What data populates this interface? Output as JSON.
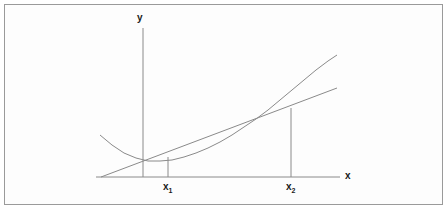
{
  "figure": {
    "kind": "math-diagram",
    "background_color": "#ffffff",
    "frame_color": "#9a9a9a",
    "stroke_color": "#8a8a8a",
    "label_color": "#1a1a1a"
  },
  "axes": {
    "y_label": "y",
    "x_label": "x",
    "origin_px": {
      "x": 143,
      "y": 177
    },
    "x_axis_from_px": 96,
    "x_axis_to_px": 340,
    "y_axis_top_px": 28,
    "y_axis_bottom_px": 177
  },
  "ticks": [
    {
      "name": "x1",
      "text": "x",
      "sub": "1",
      "x_px": 168
    },
    {
      "name": "x2",
      "text": "x",
      "sub": "2",
      "x_px": 291
    }
  ],
  "chart_data": {
    "type": "line",
    "title": "",
    "xlabel": "x",
    "ylabel": "y",
    "grid": false,
    "legend": false,
    "annotations": [
      "x₁",
      "x₂",
      "x",
      "y"
    ],
    "series": [
      {
        "name": "curve",
        "kind": "convex-curve",
        "points_px": [
          [
            100,
            135
          ],
          [
            112,
            145
          ],
          [
            124,
            153
          ],
          [
            136,
            158
          ],
          [
            148,
            161
          ],
          [
            160,
            161
          ],
          [
            172,
            160
          ],
          [
            184,
            157
          ],
          [
            196,
            153
          ],
          [
            208,
            148
          ],
          [
            220,
            142
          ],
          [
            232,
            135
          ],
          [
            244,
            127
          ],
          [
            256,
            119
          ],
          [
            268,
            110
          ],
          [
            280,
            100
          ],
          [
            292,
            90
          ],
          [
            304,
            80
          ],
          [
            316,
            70
          ],
          [
            328,
            61
          ],
          [
            337,
            55
          ]
        ]
      },
      {
        "name": "secant-line",
        "kind": "straight-line",
        "points_px": [
          [
            101,
            177
          ],
          [
            337,
            88
          ]
        ]
      }
    ],
    "dropdowns_px": [
      {
        "name": "x1-dropline",
        "x": 168,
        "y_top": 157,
        "y_bottom": 177
      },
      {
        "name": "x2-dropline",
        "x": 291,
        "y_top": 108,
        "y_bottom": 177
      }
    ]
  }
}
